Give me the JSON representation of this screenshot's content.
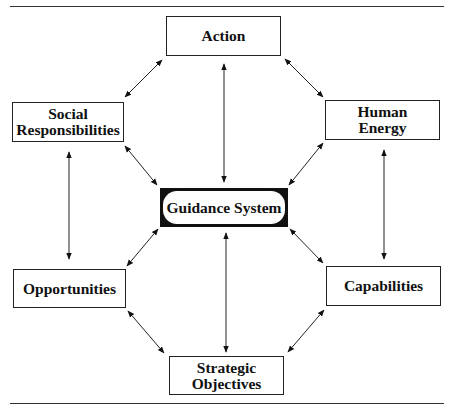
{
  "diagram": {
    "hub": {
      "id": "guidance",
      "label": "Guidance System"
    },
    "nodes": [
      {
        "id": "action",
        "label": "Action"
      },
      {
        "id": "social",
        "label": "Social\nResponsibilities"
      },
      {
        "id": "human",
        "label": "Human\nEnergy"
      },
      {
        "id": "opportunities",
        "label": "Opportunities"
      },
      {
        "id": "capabilities",
        "label": "Capabilities"
      },
      {
        "id": "strategic",
        "label": "Strategic\nObjectives"
      }
    ],
    "edges": [
      {
        "from": "action",
        "to": "social",
        "arrows": "both"
      },
      {
        "from": "action",
        "to": "human",
        "arrows": "both"
      },
      {
        "from": "action",
        "to": "guidance",
        "arrows": "both"
      },
      {
        "from": "social",
        "to": "guidance",
        "arrows": "both"
      },
      {
        "from": "human",
        "to": "guidance",
        "arrows": "both"
      },
      {
        "from": "social",
        "to": "opportunities",
        "arrows": "both"
      },
      {
        "from": "human",
        "to": "capabilities",
        "arrows": "both"
      },
      {
        "from": "opportunities",
        "to": "guidance",
        "arrows": "both"
      },
      {
        "from": "capabilities",
        "to": "guidance",
        "arrows": "both"
      },
      {
        "from": "guidance",
        "to": "strategic",
        "arrows": "both"
      },
      {
        "from": "opportunities",
        "to": "strategic",
        "arrows": "both"
      },
      {
        "from": "capabilities",
        "to": "strategic",
        "arrows": "both"
      }
    ]
  }
}
